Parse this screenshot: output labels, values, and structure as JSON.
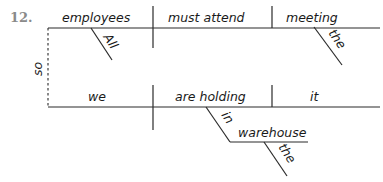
{
  "problem": {
    "number": "12."
  },
  "diagram": {
    "type": "sentence-diagram",
    "conjunction": "so",
    "clause_1": {
      "subject": "employees",
      "subject_modifier": "All",
      "verb": "must attend",
      "direct_object": "meeting",
      "object_modifier": "the"
    },
    "clause_2": {
      "subject": "we",
      "verb": "are holding",
      "direct_object": "it",
      "preposition": "in",
      "prepositional_object": "warehouse",
      "prepositional_object_modifier": "the"
    }
  }
}
